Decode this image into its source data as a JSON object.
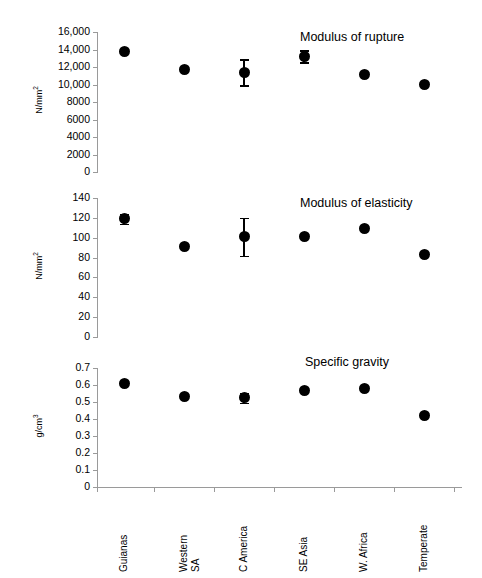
{
  "chart_data": [
    {
      "type": "scatter",
      "title": "Modulus of rupture",
      "xlabel": "",
      "ylabel": "N/mm2",
      "ylabel_display": "N/mm²",
      "ylim": [
        0,
        16000
      ],
      "ytick_step": 2000,
      "yticks": [
        0,
        2000,
        4000,
        6000,
        8000,
        10000,
        12000,
        14000,
        16000
      ],
      "ytick_labels": [
        "0",
        "2000",
        "4000",
        "6000",
        "8000",
        "10,000",
        "12,000",
        "14,000",
        "16,000"
      ],
      "grid": false,
      "legend": "none",
      "categories": [
        "Guianas",
        "Western SA",
        "C America",
        "SE Asia",
        "W. Africa",
        "Temperate"
      ],
      "values": [
        13800,
        11700,
        11400,
        13250,
        11200,
        9950
      ],
      "errors": [
        0,
        0,
        1500,
        700,
        0,
        0
      ]
    },
    {
      "type": "scatter",
      "title": "Modulus of elasticity",
      "xlabel": "",
      "ylabel": "N/mm2",
      "ylabel_display": "N/mm²",
      "ylim": [
        0,
        140
      ],
      "ytick_step": 20,
      "yticks": [
        0,
        20,
        40,
        60,
        80,
        100,
        120,
        140
      ],
      "ytick_labels": [
        "0",
        "20",
        "40",
        "60",
        "80",
        "100",
        "120",
        "140"
      ],
      "grid": false,
      "legend": "none",
      "categories": [
        "Guianas",
        "Western SA",
        "C America",
        "SE Asia",
        "W. Africa",
        "Temperate"
      ],
      "values": [
        119,
        91,
        101,
        101,
        109,
        83
      ],
      "errors": [
        5,
        0,
        19,
        0,
        0,
        0
      ]
    },
    {
      "type": "scatter",
      "title": "Specific gravity",
      "xlabel": "",
      "ylabel": "g/cm3",
      "ylabel_display": "g/cm³",
      "ylim": [
        0,
        0.7
      ],
      "ytick_step": 0.1,
      "yticks": [
        0,
        0.1,
        0.2,
        0.3,
        0.4,
        0.5,
        0.6,
        0.7
      ],
      "ytick_labels": [
        "0",
        "0.1",
        "0.2",
        "0.3",
        "0.4",
        "0.5",
        "0.6",
        "0.7"
      ],
      "grid": false,
      "legend": "none",
      "categories": [
        "Guianas",
        "Western SA",
        "C America",
        "SE Asia",
        "W. Africa",
        "Temperate"
      ],
      "values": [
        0.61,
        0.53,
        0.525,
        0.57,
        0.58,
        0.42
      ],
      "errors": [
        0,
        0,
        0.03,
        0,
        0,
        0
      ]
    }
  ],
  "axis": {
    "categories": [
      {
        "label": "Guianas",
        "lines": [
          "Guianas"
        ]
      },
      {
        "label": "Western SA",
        "lines": [
          "Western",
          "SA"
        ]
      },
      {
        "label": "C America",
        "lines": [
          "C America"
        ]
      },
      {
        "label": "SE Asia",
        "lines": [
          "SE Asia"
        ]
      },
      {
        "label": "W. Africa",
        "lines": [
          "W. Africa"
        ]
      },
      {
        "label": "Temperate",
        "lines": [
          "Temperate"
        ]
      }
    ]
  },
  "colors": {
    "marker": "#000000",
    "axis": "#9a9a9a",
    "text": "#000000",
    "background": "#ffffff"
  }
}
